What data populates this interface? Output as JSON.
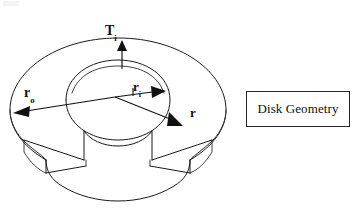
{
  "figure": {
    "kind": "technical-line-drawing",
    "caption": {
      "text": "Disk Geometry"
    },
    "labels": {
      "outer_radius": {
        "base": "r",
        "subscript": "o"
      },
      "inner_radius": {
        "base": "r",
        "subscript": "i"
      },
      "general_radius": {
        "base": "r",
        "subscript": ""
      },
      "inner_temperature": {
        "base": "T",
        "subscript": "i"
      }
    },
    "annotations": [
      {
        "name": "outer-radius-arrow",
        "label": "r_o",
        "direction": "left",
        "from": "disk-center",
        "to": "outer-edge"
      },
      {
        "name": "inner-radius-arrow",
        "label": "r_i",
        "direction": "right",
        "from": "disk-center",
        "to": "inner-hole-edge"
      },
      {
        "name": "radius-arrow",
        "label": "r",
        "direction": "down-right",
        "from": "disk-center",
        "to": "mid-annulus"
      },
      {
        "name": "inner-temperature-arrow",
        "label": "T_i",
        "direction": "up",
        "from": "inner-hole-top-edge",
        "to": "above-disk"
      }
    ],
    "colors": {
      "stroke": "#1a1a1a",
      "background": "#ffffff",
      "caption_border": "#262626",
      "text": "#111111"
    }
  }
}
